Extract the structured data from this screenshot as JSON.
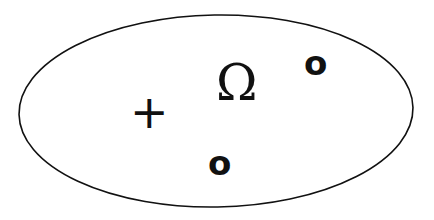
{
  "diagram": {
    "type": "sample-space",
    "boundary": {
      "shape": "ellipse",
      "stroke": "#111111",
      "fill": "#ffffff",
      "cx": 216,
      "cy": 111,
      "rx": 197,
      "ry": 96
    },
    "label": "Ω",
    "elements": [
      {
        "symbol": "+",
        "role": "outcome"
      },
      {
        "symbol": "o",
        "role": "outcome"
      },
      {
        "symbol": "o",
        "role": "outcome"
      }
    ]
  }
}
